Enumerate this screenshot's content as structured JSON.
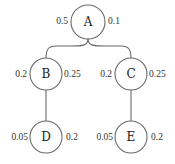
{
  "diagram": {
    "type": "tree",
    "nodes": [
      {
        "id": "A",
        "label": "A",
        "cx": 88,
        "cy": 22,
        "r": 17,
        "left_value": "0.5",
        "right_value": "0.1"
      },
      {
        "id": "B",
        "label": "B",
        "cx": 46,
        "cy": 74,
        "r": 16,
        "left_value": "0.2",
        "right_value": "0.25"
      },
      {
        "id": "C",
        "label": "C",
        "cx": 131,
        "cy": 74,
        "r": 16,
        "left_value": "0.2",
        "right_value": "0.25"
      },
      {
        "id": "D",
        "label": "D",
        "cx": 46,
        "cy": 137,
        "r": 16,
        "left_value": "0.05",
        "right_value": "0.2"
      },
      {
        "id": "E",
        "label": "E",
        "cx": 131,
        "cy": 137,
        "r": 16,
        "left_value": "0.05",
        "right_value": "0.2"
      }
    ],
    "edges": [
      {
        "from": "A",
        "to": "B"
      },
      {
        "from": "A",
        "to": "C"
      },
      {
        "from": "B",
        "to": "D"
      },
      {
        "from": "C",
        "to": "E"
      }
    ]
  }
}
